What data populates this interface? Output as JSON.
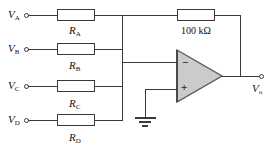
{
  "figure_type": "circuit-diagram",
  "colors": {
    "wire": "#3a3a3a",
    "opamp_fill": "#cbcbcb",
    "opamp_stroke": "#5a5a5a",
    "text": "#111111",
    "background": "#ffffff"
  },
  "inputs": [
    {
      "sym": "V",
      "sub": "A"
    },
    {
      "sym": "V",
      "sub": "B"
    },
    {
      "sym": "V",
      "sub": "C"
    },
    {
      "sym": "V",
      "sub": "D"
    }
  ],
  "resistors": [
    {
      "sym": "R",
      "sub": "A"
    },
    {
      "sym": "R",
      "sub": "B"
    },
    {
      "sym": "R",
      "sub": "C"
    },
    {
      "sym": "R",
      "sub": "D"
    }
  ],
  "feedback": {
    "value": "100 kΩ"
  },
  "opamp": {
    "inverting": "−",
    "noninverting": "+"
  },
  "output": {
    "sym": "V",
    "sub": "o"
  }
}
